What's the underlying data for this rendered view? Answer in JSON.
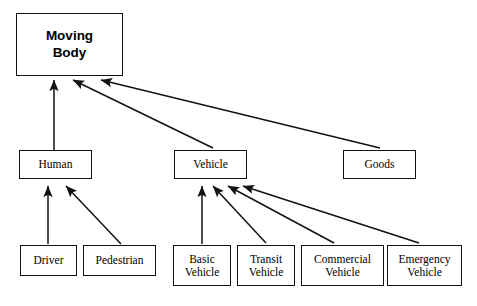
{
  "diagram": {
    "type": "generalization-hierarchy",
    "background_color": "#ffffff",
    "line_color": "#121212",
    "text_color": "#000000",
    "root": {
      "id": "moving-body",
      "label": "Moving\nBody",
      "x": 16,
      "y": 13,
      "w": 107,
      "h": 63
    },
    "level1": [
      {
        "id": "human",
        "label": "Human",
        "x": 19,
        "y": 150,
        "w": 73,
        "h": 29
      },
      {
        "id": "vehicle",
        "label": "Vehicle",
        "x": 174,
        "y": 150,
        "w": 73,
        "h": 29
      },
      {
        "id": "goods",
        "label": "Goods",
        "x": 343,
        "y": 150,
        "w": 73,
        "h": 29
      }
    ],
    "level2": [
      {
        "id": "driver",
        "label": "Driver",
        "x": 20,
        "y": 245,
        "w": 57,
        "h": 31
      },
      {
        "id": "pedestrian",
        "label": "Pedestrian",
        "x": 83,
        "y": 245,
        "w": 73,
        "h": 31
      },
      {
        "id": "basic-vehicle",
        "label": "Basic\nVehicle",
        "x": 173,
        "y": 245,
        "w": 58,
        "h": 41
      },
      {
        "id": "transit-vehicle",
        "label": "Transit\nVehicle",
        "x": 237,
        "y": 245,
        "w": 58,
        "h": 41
      },
      {
        "id": "commercial-vehicle",
        "label": "Commercial\nVehicle",
        "x": 301,
        "y": 245,
        "w": 83,
        "h": 41
      },
      {
        "id": "emergency-vehicle",
        "label": "Emergency\nVehicle",
        "x": 387,
        "y": 245,
        "w": 75,
        "h": 41
      }
    ],
    "edges": [
      {
        "id": "human-to-moving-body",
        "from": "human",
        "to": "moving-body",
        "x1": 54,
        "y1": 150,
        "x2": 54,
        "y2": 80
      },
      {
        "id": "vehicle-to-moving-body",
        "from": "vehicle",
        "to": "moving-body",
        "x1": 213,
        "y1": 148,
        "x2": 73,
        "y2": 80
      },
      {
        "id": "goods-to-moving-body",
        "from": "goods",
        "to": "moving-body",
        "x1": 380,
        "y1": 148,
        "x2": 101,
        "y2": 80
      },
      {
        "id": "driver-to-human",
        "from": "driver",
        "to": "human",
        "x1": 48,
        "y1": 244,
        "x2": 48,
        "y2": 186
      },
      {
        "id": "pedestrian-to-human",
        "from": "pedestrian",
        "to": "human",
        "x1": 121,
        "y1": 244,
        "x2": 66,
        "y2": 186
      },
      {
        "id": "basic-vehicle-to-vehicle",
        "from": "basic-vehicle",
        "to": "vehicle",
        "x1": 202,
        "y1": 244,
        "x2": 202,
        "y2": 186
      },
      {
        "id": "transit-vehicle-to-vehicle",
        "from": "transit-vehicle",
        "to": "vehicle",
        "x1": 266,
        "y1": 243,
        "x2": 213,
        "y2": 186
      },
      {
        "id": "commercial-vehicle-to-vehicle",
        "from": "commercial-vehicle",
        "to": "vehicle",
        "x1": 334,
        "y1": 243,
        "x2": 228,
        "y2": 186
      },
      {
        "id": "emergency-vehicle-to-vehicle",
        "from": "emergency-vehicle",
        "to": "vehicle",
        "x1": 419,
        "y1": 243,
        "x2": 243,
        "y2": 186
      }
    ]
  }
}
